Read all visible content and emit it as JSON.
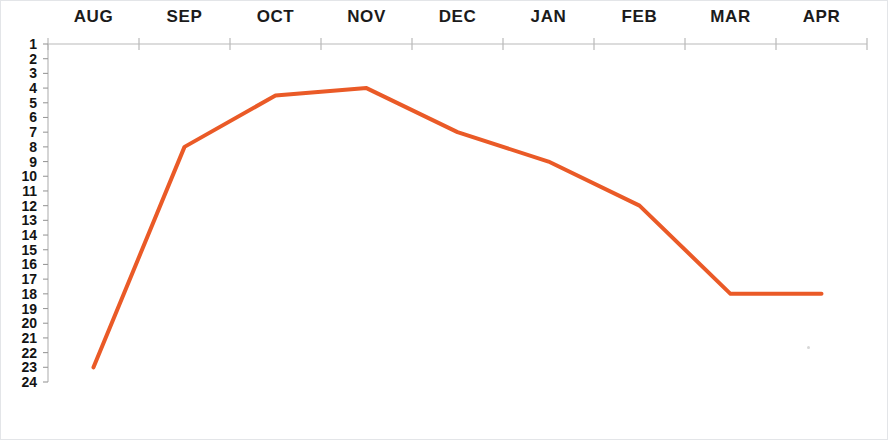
{
  "chart_data": {
    "type": "line",
    "title": "",
    "subtitle": "",
    "xlabel": "",
    "ylabel": "",
    "categories": [
      "AUG",
      "SEP",
      "OCT",
      "NOV",
      "DEC",
      "JAN",
      "FEB",
      "MAR",
      "APR"
    ],
    "series": [
      {
        "name": "Rank",
        "values": [
          23,
          8,
          4.5,
          4,
          7,
          9,
          12,
          18,
          18
        ],
        "color": "#ea5a27"
      }
    ],
    "ylim": [
      1,
      24
    ],
    "y_inverted": true,
    "y_tick_labels": [
      "1",
      "2",
      "3",
      "4",
      "5",
      "6",
      "7",
      "8",
      "9",
      "10",
      "11",
      "12",
      "13",
      "14",
      "15",
      "16",
      "17",
      "18",
      "19",
      "20",
      "21",
      "22",
      "23",
      "24"
    ],
    "y_tick_values": [
      1,
      2,
      3,
      4,
      5,
      6,
      7,
      8,
      9,
      10,
      11,
      12,
      13,
      14,
      15,
      16,
      17,
      18,
      19,
      20,
      21,
      22,
      23,
      24
    ],
    "x_tick_labels": [
      "AUG",
      "SEP",
      "OCT",
      "NOV",
      "DEC",
      "JAN",
      "FEB",
      "MAR",
      "APR"
    ],
    "grid": false,
    "legend": false,
    "legend_position": "none",
    "axis_position": "top",
    "axis_color": "#b9b9b9",
    "line_width": 4,
    "annotations": []
  },
  "colors": {
    "line": "#ea5a27",
    "axis": "#b9b9b9",
    "tick": "#9a9a9a",
    "text": "#141414",
    "background": "#ffffff",
    "border": "#e3e5e8"
  },
  "axis_geometry": {
    "plot_left": 47,
    "plot_right": 866,
    "plot_top": 43,
    "plot_bottom": 381
  }
}
